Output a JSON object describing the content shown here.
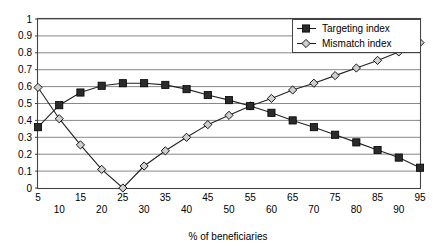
{
  "chart_data": {
    "type": "line",
    "title": "",
    "xlabel": "% of beneficiaries",
    "ylabel": "",
    "x": [
      5,
      10,
      15,
      20,
      25,
      30,
      35,
      40,
      45,
      50,
      55,
      60,
      65,
      70,
      75,
      80,
      85,
      90,
      95
    ],
    "xlim": [
      5,
      95
    ],
    "ylim": [
      0,
      1
    ],
    "yticks": [
      "0",
      "0.1",
      "0.2",
      "0.3",
      "0.4",
      "0.5",
      "0.6",
      "0.7",
      "0.8",
      "0.9",
      "1"
    ],
    "xticks": [
      "5",
      "10",
      "15",
      "20",
      "25",
      "30",
      "35",
      "40",
      "45",
      "50",
      "55",
      "60",
      "65",
      "70",
      "75",
      "80",
      "85",
      "90",
      "95"
    ],
    "grid": true,
    "legend_position": "top-right",
    "series": [
      {
        "name": "Targeting index",
        "marker": "filled-square",
        "values": [
          0.36,
          0.49,
          0.565,
          0.605,
          0.62,
          0.62,
          0.61,
          0.585,
          0.55,
          0.52,
          0.485,
          0.445,
          0.4,
          0.36,
          0.315,
          0.27,
          0.225,
          0.18,
          0.12
        ]
      },
      {
        "name": "Mismatch index",
        "marker": "open-diamond",
        "values": [
          0.595,
          0.41,
          0.255,
          0.11,
          0.0,
          0.13,
          0.22,
          0.3,
          0.375,
          0.43,
          0.485,
          0.53,
          0.58,
          0.62,
          0.665,
          0.71,
          0.755,
          0.805,
          0.86
        ]
      }
    ]
  },
  "legend": {
    "items": [
      {
        "label": "Targeting index"
      },
      {
        "label": "Mismatch index"
      }
    ]
  },
  "axis": {
    "x_title": "% of beneficiaries"
  }
}
